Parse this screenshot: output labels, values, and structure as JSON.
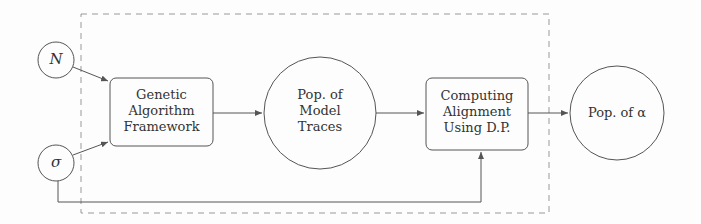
{
  "diagram": {
    "inputs": [
      {
        "id": "N",
        "label": "N"
      },
      {
        "id": "sigma",
        "label": "σ"
      }
    ],
    "nodes": {
      "ga": {
        "lines": [
          "Genetic",
          "Algorithm",
          "Framework"
        ]
      },
      "traces": {
        "lines": [
          "Pop. of",
          "Model",
          "Traces"
        ]
      },
      "align": {
        "lines": [
          "Computing",
          "Alignment",
          "Using D.P."
        ]
      },
      "output": {
        "label": "Pop. of α"
      }
    },
    "edges": [
      {
        "from": "N",
        "to": "ga"
      },
      {
        "from": "sigma",
        "to": "ga"
      },
      {
        "from": "ga",
        "to": "traces"
      },
      {
        "from": "traces",
        "to": "align"
      },
      {
        "from": "align",
        "to": "output"
      },
      {
        "from": "sigma",
        "to": "align",
        "routing": "below"
      }
    ],
    "colors": {
      "stroke": "#555555",
      "dash": "#888888",
      "text": "#333333"
    }
  }
}
